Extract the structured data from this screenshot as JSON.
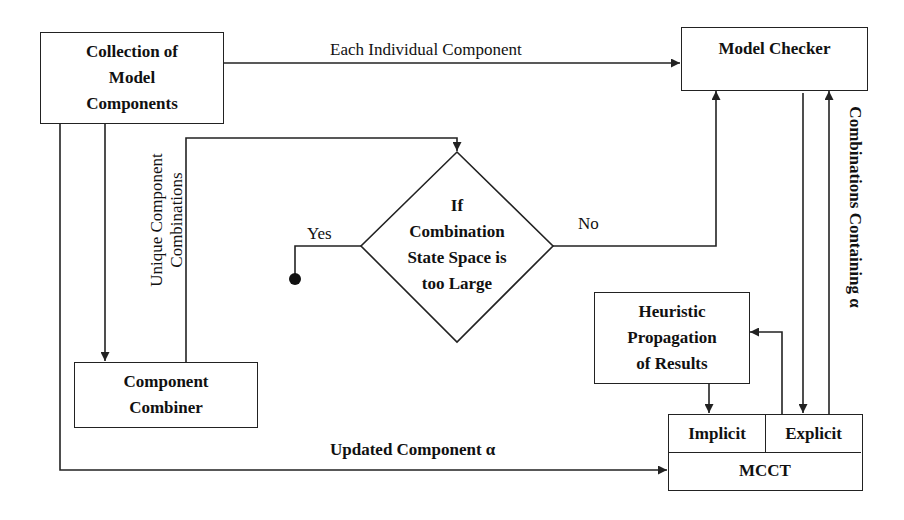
{
  "nodes": {
    "collection": {
      "lines": [
        "Collection of",
        "Model",
        "Components"
      ]
    },
    "model_checker": {
      "label": "Model Checker"
    },
    "decision": {
      "lines": [
        "If",
        "Combination",
        "State Space is",
        "too Large"
      ]
    },
    "combiner": {
      "lines": [
        "Component",
        "Combiner"
      ]
    },
    "heuristic": {
      "lines": [
        "Heuristic",
        "Propagation",
        "of Results"
      ]
    },
    "mcct": {
      "label": "MCCT",
      "implicit_label": "Implicit",
      "explicit_label": "Explicit"
    }
  },
  "edges": {
    "each_individual": "Each Individual Component",
    "unique_combinations": [
      "Unique Component",
      "Combinations"
    ],
    "yes": "Yes",
    "no": "No",
    "combinations_containing": "Combinations Containing α",
    "updated_component": "Updated Component α"
  },
  "colors": {
    "stroke": "#222222",
    "background": "#ffffff",
    "text": "#111111"
  }
}
